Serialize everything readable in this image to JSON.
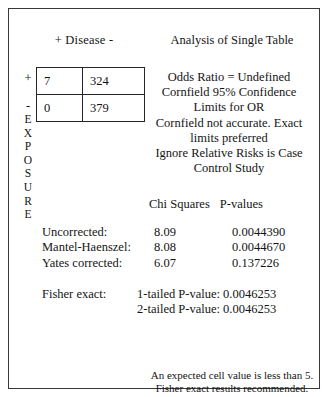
{
  "dialog": {
    "title": "Analysis of Single Table"
  },
  "table2x2": {
    "column_header": "+ Disease -",
    "row_axis_label": "EXPOSURE",
    "row_signs": [
      "+",
      "-"
    ],
    "cells": [
      [
        "7",
        "324"
      ],
      [
        "0",
        "379"
      ]
    ]
  },
  "summary": {
    "lines": [
      "Odds Ratio = Undefined",
      "Cornfield 95% Confidence",
      "Limits for OR",
      "Cornfield not accurate. Exact",
      "limits preferred",
      "Ignore Relative Risks is Case",
      "Control Study"
    ]
  },
  "stats": {
    "header_chi": "Chi Squares",
    "header_p": "P-values",
    "rows": [
      {
        "label": "Uncorrected:",
        "chi": "8.09",
        "p": "0.0044390"
      },
      {
        "label": "Mantel-Haenszel:",
        "chi": "8.08",
        "p": "0.0044670"
      },
      {
        "label": "Yates corrected:",
        "chi": "6.07",
        "p": "0.137226"
      }
    ],
    "fisher": {
      "label": "Fisher exact:",
      "one_tailed": "1-tailed P-value: 0.0046253",
      "two_tailed": "2-tailed P-value: 0.0046253"
    }
  },
  "note": {
    "line1": "An expected cell value is less than 5.",
    "line2": "Fisher exact results recommended."
  }
}
